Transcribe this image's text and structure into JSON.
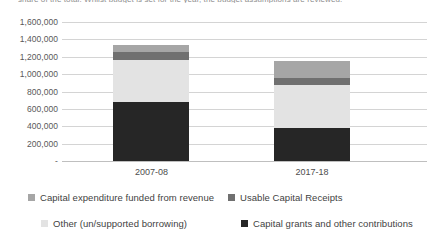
{
  "caption_sliver": "share of the total. Whilst budget is set for the year, the budget assumptions are reviewed.",
  "chart_data": {
    "type": "bar",
    "subtype": "stacked-bar",
    "title": "",
    "xlabel": "",
    "ylabel": "",
    "categories": [
      "2007-08",
      "2017-18"
    ],
    "ylim": [
      0,
      1600000
    ],
    "ytick_labels": [
      "1,600,000",
      "1,400,000",
      "1,200,000",
      "1,000,000",
      "800,000",
      "600,000",
      "400,000",
      "200,000",
      "-"
    ],
    "ytick_values": [
      1600000,
      1400000,
      1200000,
      1000000,
      800000,
      600000,
      400000,
      200000,
      0
    ],
    "grid": true,
    "legend_position": "bottom",
    "stack_order_bottom_to_top": [
      "Capital grants and other contributions",
      "Other (un/supported borrowing)",
      "Usable Capital Receipts",
      "Capital expenditure funded from revenue"
    ],
    "series": [
      {
        "name": "Capital grants and other contributions",
        "color": "#262626",
        "values": [
          680000,
          380000
        ]
      },
      {
        "name": "Other (un/supported borrowing)",
        "color": "#e3e3e3",
        "values": [
          480000,
          495000
        ]
      },
      {
        "name": "Usable Capital Receipts",
        "color": "#707070",
        "values": [
          90000,
          80000
        ]
      },
      {
        "name": "Capital expenditure funded from revenue",
        "color": "#a6a6a6",
        "values": [
          90000,
          195000
        ]
      }
    ],
    "totals": [
      1340000,
      1150000
    ]
  },
  "legend": {
    "rows": [
      [
        {
          "label": "Capital expenditure funded from revenue",
          "color": "#a6a6a6"
        },
        {
          "label": "Usable Capital Receipts",
          "color": "#707070"
        }
      ],
      [
        {
          "label": "Other (un/supported borrowing)",
          "color": "#e3e3e3"
        },
        {
          "label": "Capital grants and other contributions",
          "color": "#262626"
        }
      ]
    ]
  }
}
